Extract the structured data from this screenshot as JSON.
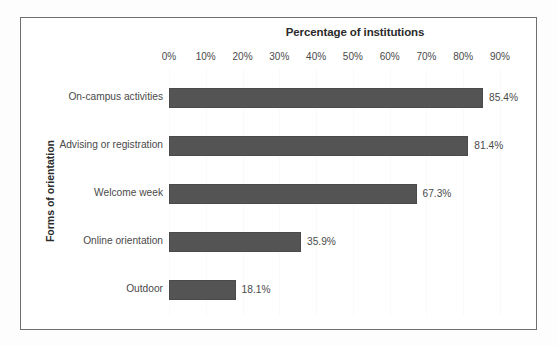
{
  "chart_data": {
    "type": "bar",
    "orientation": "horizontal",
    "title": "Percentage of institutions",
    "xlabel": "Percentage of institutions",
    "ylabel": "Forms of orientation",
    "categories": [
      "On-campus activities",
      "Advising or registration",
      "Welcome week",
      "Online orientation",
      "Outdoor"
    ],
    "values": [
      85.4,
      81.4,
      67.3,
      35.9,
      18.1
    ],
    "value_labels": [
      "85.4%",
      "81.4%",
      "67.3%",
      "35.9%",
      "18.1%"
    ],
    "xlim": [
      0,
      90
    ],
    "xticks": [
      0,
      10,
      20,
      30,
      40,
      50,
      60,
      70,
      80,
      90
    ],
    "xtick_labels": [
      "0%",
      "10%",
      "20%",
      "30%",
      "40%",
      "50%",
      "60%",
      "70%",
      "80%",
      "90%"
    ],
    "grid": true,
    "legend": "none",
    "bar_color": "#545454",
    "frame_color": "#6f6f6f",
    "text_color": "#4a4a4a",
    "background": "#ffffff"
  }
}
